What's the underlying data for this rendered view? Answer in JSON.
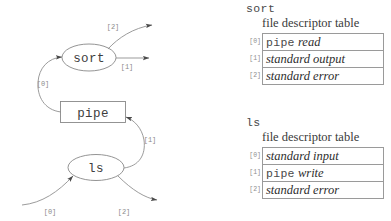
{
  "diagram": {
    "nodes": [
      {
        "id": "sort",
        "label": "sort",
        "shape": "ellipse"
      },
      {
        "id": "pipe",
        "label": "pipe",
        "shape": "box"
      },
      {
        "id": "ls",
        "label": "ls",
        "shape": "ellipse"
      }
    ],
    "edge_labels": {
      "sort_stderr": "[2]",
      "sort_stdout": "[1]",
      "sort_stdin": "[0]",
      "ls_stdout": "[1]",
      "ls_stdin": "[0]",
      "ls_stderr": "[2]"
    },
    "stroke_color": "#909090",
    "label_color": "#8a8a8a",
    "node_text_color": "#3d3d3d"
  },
  "tables": [
    {
      "process": "sort",
      "caption": "file descriptor table",
      "rows": [
        {
          "index": "[0]",
          "mono": "pipe",
          "italic": "read"
        },
        {
          "index": "[1]",
          "mono": "",
          "italic": "standard output"
        },
        {
          "index": "[2]",
          "mono": "",
          "italic": "standard error"
        }
      ]
    },
    {
      "process": "ls",
      "caption": "file descriptor table",
      "rows": [
        {
          "index": "[0]",
          "mono": "",
          "italic": "standard input"
        },
        {
          "index": "[1]",
          "mono": "pipe",
          "italic": "write"
        },
        {
          "index": "[2]",
          "mono": "",
          "italic": "standard error"
        }
      ]
    }
  ]
}
